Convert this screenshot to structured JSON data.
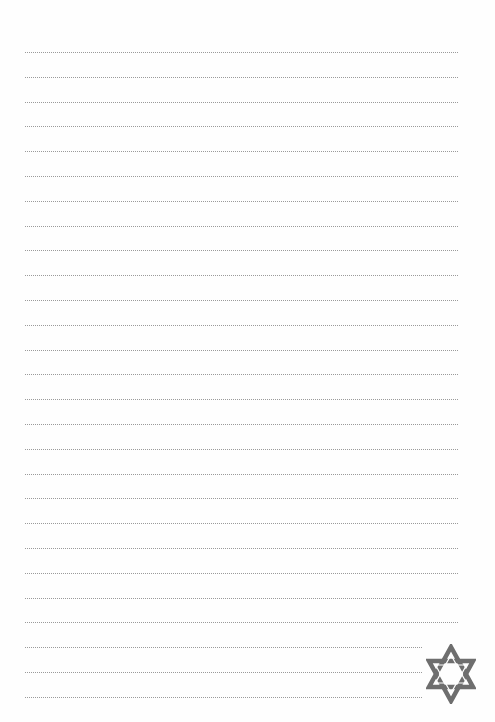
{
  "page": {
    "type": "lined-writing-paper",
    "background_color": "#fefefe",
    "rule_color": "#9a9a9a",
    "rule_style": "dotted",
    "rule_count": 27,
    "rule_left_px": 25,
    "rule_first_y_px": 52,
    "rule_spacing_px": 24.8,
    "rule_full_right_px": 458,
    "rule_short_right_px": 422,
    "short_rule_count": 3
  },
  "emblem": {
    "icon": "star-of-david-icon",
    "color": "#6e6e6e",
    "position": "bottom-right"
  }
}
